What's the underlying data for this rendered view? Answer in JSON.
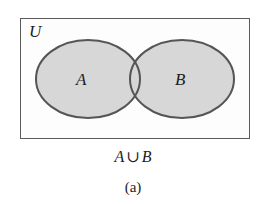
{
  "figure": {
    "type": "venn-diagram",
    "label": "(a)",
    "caption_expression": {
      "left_set": "A",
      "operator": "∪",
      "right_set": "B",
      "full": "A ∪ B"
    },
    "universe_label": "U",
    "sets": [
      {
        "id": "A",
        "label": "A",
        "shaded": true
      },
      {
        "id": "B",
        "label": "B",
        "shaded": true
      }
    ],
    "shaded_region": "union",
    "colors": {
      "set_fill": "#d7d7d7",
      "set_stroke": "#555555",
      "box_stroke": "#5a5a5a",
      "box_fill": "#fdfdfd",
      "page_background": "#ffffff",
      "text": "#1d1d1d"
    },
    "geometry": {
      "box": {
        "x": 20,
        "y": 18,
        "width": 230,
        "height": 121
      },
      "ellipse_a": {
        "cx": 88,
        "cy": 79,
        "rx": 52,
        "ry": 39
      },
      "ellipse_b": {
        "cx": 182,
        "cy": 79,
        "rx": 52,
        "ry": 39
      }
    }
  }
}
